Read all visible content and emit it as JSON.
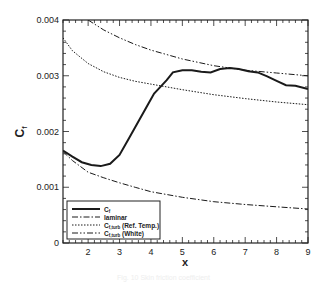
{
  "chart_data": {
    "type": "line",
    "title": "",
    "xlabel": "x",
    "ylabel": "C_f",
    "xlim": [
      1.2,
      9
    ],
    "ylim": [
      0,
      0.004
    ],
    "grid": false,
    "legend_position": "lower left",
    "x_ticks": [
      2,
      3,
      4,
      5,
      6,
      7,
      8,
      9
    ],
    "x_tick_labels": [
      "2",
      "3",
      "4",
      "5",
      "6",
      "7",
      "8",
      "9"
    ],
    "y_ticks": [
      0,
      0.001,
      0.002,
      0.003,
      0.004
    ],
    "y_tick_labels": [
      "0",
      "0.001",
      "0.002",
      "0.003",
      "0.004"
    ],
    "series": [
      {
        "name": "C_f",
        "legend_main": "C",
        "legend_sub": "f",
        "legend_suffix": "",
        "style": "solid",
        "width": 2,
        "x": [
          1.2,
          1.5,
          1.8,
          2.1,
          2.4,
          2.7,
          3.0,
          3.3,
          3.6,
          3.9,
          4.1,
          4.3,
          4.5,
          4.7,
          5.0,
          5.3,
          5.6,
          5.9,
          6.2,
          6.5,
          6.8,
          7.1,
          7.4,
          7.7,
          8.0,
          8.3,
          8.6,
          9.0
        ],
        "y": [
          0.00166,
          0.00155,
          0.00145,
          0.0014,
          0.00138,
          0.00142,
          0.00158,
          0.00188,
          0.00218,
          0.00248,
          0.00268,
          0.0028,
          0.00292,
          0.00306,
          0.0031,
          0.0031,
          0.00307,
          0.00306,
          0.00312,
          0.00314,
          0.00312,
          0.00308,
          0.00306,
          0.00299,
          0.00291,
          0.00283,
          0.00282,
          0.00276
        ]
      },
      {
        "name": "laminar",
        "legend_main": "laminar",
        "legend_sub": "",
        "legend_suffix": "",
        "style": "dashdot",
        "width": 1,
        "x": [
          1.2,
          1.5,
          2.0,
          2.5,
          3.0,
          3.5,
          4.0,
          5.0,
          6.0,
          7.0,
          8.0,
          9.0
        ],
        "y": [
          0.00164,
          0.00148,
          0.00127,
          0.00117,
          0.00108,
          0.001,
          0.00092,
          0.00082,
          0.00074,
          0.00069,
          0.00065,
          0.00061
        ]
      },
      {
        "name": "C_f,turb (Ref. Temp.)",
        "legend_main": "C",
        "legend_sub": "f,turb",
        "legend_suffix": " (Ref. Temp.)",
        "style": "dotted",
        "width": 1,
        "x": [
          1.2,
          1.5,
          2.0,
          2.5,
          3.0,
          3.5,
          4.0,
          5.0,
          6.0,
          7.0,
          8.0,
          9.0
        ],
        "y": [
          0.00368,
          0.00345,
          0.00322,
          0.00307,
          0.00297,
          0.0029,
          0.00285,
          0.00275,
          0.00266,
          0.00259,
          0.00253,
          0.00248
        ]
      },
      {
        "name": "C_f,turb (White)",
        "legend_main": "C",
        "legend_sub": "f,turb",
        "legend_suffix": " (White)",
        "style": "dashdotdot",
        "width": 1,
        "x": [
          2.0,
          2.5,
          3.0,
          3.5,
          4.0,
          5.0,
          6.0,
          7.0,
          8.0,
          9.0
        ],
        "y": [
          0.004,
          0.00382,
          0.00368,
          0.00356,
          0.00346,
          0.0033,
          0.00318,
          0.0031,
          0.00305,
          0.003
        ]
      }
    ]
  },
  "caption": "Fig. 10 Skin friction coefficient"
}
